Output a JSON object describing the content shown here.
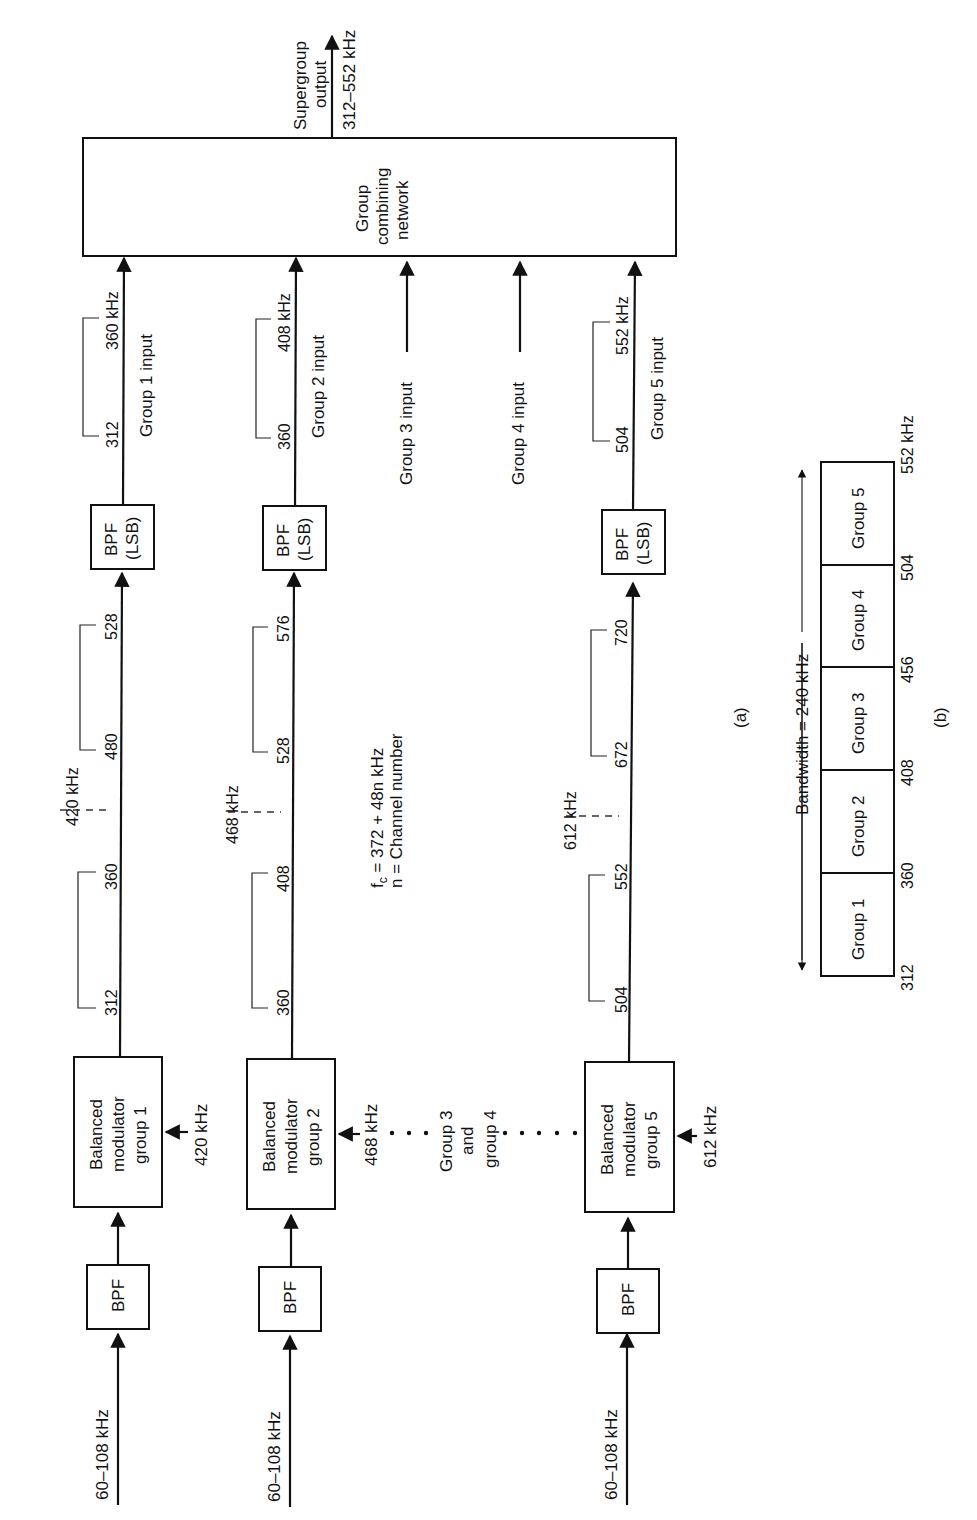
{
  "figure": {
    "part_a_label": "(a)",
    "part_b_label": "(b)"
  },
  "input": {
    "band": "60–108 kHz"
  },
  "blocks": {
    "bpf": "BPF",
    "bpf_lsb_line1": "BPF",
    "bpf_lsb_line2": "(LSB)",
    "modulator_line1": "Balanced",
    "modulator_line2": "modulator",
    "combiner_line1": "Group",
    "combiner_line2": "combining",
    "combiner_line3": "network"
  },
  "groups": [
    {
      "id": 1,
      "modulator_line3": "group 1",
      "carrier": "420 kHz",
      "carrier_marker": "420 kHz",
      "lsb_low": "312",
      "lsb_high": "360",
      "usb_low": "480",
      "usb_high": "528",
      "out_low": "312",
      "out_high": "360 kHz",
      "input_label": "Group 1 input"
    },
    {
      "id": 2,
      "modulator_line3": "group 2",
      "carrier": "468 kHz",
      "carrier_marker": "468 kHz",
      "lsb_low": "360",
      "lsb_high": "408",
      "usb_low": "528",
      "usb_high": "576",
      "out_low": "360",
      "out_high": "408 kHz",
      "input_label": "Group 2 input"
    },
    {
      "id": 5,
      "modulator_line3": "group 5",
      "carrier": "612 kHz",
      "carrier_marker": "612 kHz",
      "lsb_low": "504",
      "lsb_high": "552",
      "usb_low": "672",
      "usb_high": "720",
      "out_low": "504",
      "out_high": "552 kHz",
      "input_label": "Group 5 input"
    }
  ],
  "omitted": {
    "line1": "Group 3",
    "line2": "and",
    "line3": "group 4",
    "group3_input": "Group 3 input",
    "group4_input": "Group 4 input"
  },
  "formula": {
    "line1_f": "f",
    "line1_sub": "c",
    "line1_rest": " = 372 + 48n kHz",
    "line2": "n = Channel number"
  },
  "output": {
    "line1": "Supergroup",
    "line2": "output",
    "band": "312–552 kHz"
  },
  "spectrum": {
    "bandwidth_label": "Bandwidth = 240 kHz",
    "cells": [
      "Group 1",
      "Group 2",
      "Group 3",
      "Group 4",
      "Group 5"
    ],
    "edges": [
      "312",
      "360",
      "408",
      "456",
      "504",
      "552 kHz"
    ]
  }
}
